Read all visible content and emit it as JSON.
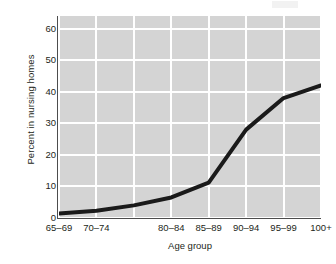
{
  "chart_data": {
    "type": "line",
    "title": "",
    "subtitle": "",
    "xlabel": "Age group",
    "ylabel": "Percent in nursing homes",
    "categories": [
      "65–69",
      "70–74",
      "",
      "80–84",
      "85–89",
      "90–94",
      "95–99",
      "100+"
    ],
    "x_tick_labels": [
      "65–69",
      "70–74",
      "80–84",
      "85–89",
      "90–94",
      "95–99",
      "100+"
    ],
    "values": [
      1.4,
      2.3,
      4.0,
      6.5,
      11.2,
      28.0,
      38.0,
      42.0
    ],
    "series": [
      {
        "name": "Percent in nursing homes",
        "values": [
          1.4,
          2.3,
          4.0,
          6.5,
          11.2,
          28.0,
          38.0,
          42.0
        ],
        "color": "#1a1a1a"
      }
    ],
    "y_ticks": [
      0,
      10,
      20,
      30,
      40,
      50,
      60
    ],
    "ylim": [
      0,
      64
    ],
    "xlim": [
      0,
      7
    ],
    "grid": true,
    "grid_color": "#ffffff",
    "plot_background": "#d4d4d4",
    "figure_background": "#ffffff",
    "legend": "none",
    "line_width_px": 4
  },
  "axes": {
    "y_title": "Percent in nursing homes",
    "x_title": "Age group",
    "y_tick_labels": [
      "0",
      "10",
      "20",
      "30",
      "40",
      "50",
      "60"
    ],
    "x_tick_labels": [
      "65–69",
      "70–74",
      "80–84",
      "85–89",
      "90–94",
      "95–99",
      "100+"
    ]
  },
  "colors": {
    "line": "#1a1a1a",
    "plot_bg": "#d4d4d4",
    "grid": "#ffffff",
    "axis": "#4d4d4d",
    "text": "#231f20"
  }
}
